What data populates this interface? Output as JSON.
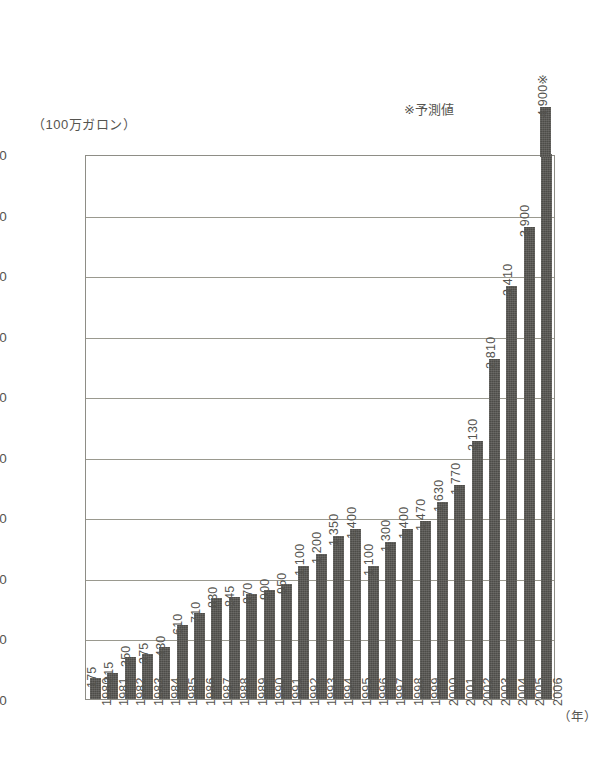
{
  "chart_data": {
    "type": "bar",
    "title": "",
    "subtitle": "",
    "xlabel": "（年）",
    "ylabel": "（100万ガロン）",
    "ylim": [
      0,
      4500
    ],
    "ytick_step": 500,
    "ytick_labels": [
      "0",
      "500",
      "1,000",
      "1,500",
      "2,000",
      "2,500",
      "3,000",
      "3,500",
      "4,000",
      "4,500"
    ],
    "ytick_values": [
      0,
      500,
      1000,
      1500,
      2000,
      2500,
      3000,
      3500,
      4000,
      4500
    ],
    "grid": true,
    "grid_axis": "y",
    "legend": false,
    "categories": [
      "1980",
      "1981",
      "1982",
      "1983",
      "1984",
      "1985",
      "1986",
      "1987",
      "1988",
      "1989",
      "1990",
      "1991",
      "1992",
      "1993",
      "1994",
      "1995",
      "1996",
      "1997",
      "1998",
      "1999",
      "2000",
      "2001",
      "2002",
      "2003",
      "2004",
      "2005",
      "2006"
    ],
    "values": [
      175,
      215,
      350,
      375,
      430,
      610,
      710,
      830,
      845,
      870,
      900,
      950,
      1100,
      1200,
      1350,
      1400,
      1100,
      1300,
      1400,
      1470,
      1630,
      1770,
      2130,
      2810,
      3410,
      3900,
      4900
    ],
    "value_labels": [
      "175",
      "215",
      "350",
      "375",
      "430",
      "610",
      "710",
      "830",
      "845",
      "870",
      "900",
      "950",
      "1,100",
      "1,200",
      "1,350",
      "1,400",
      "1,100",
      "1,300",
      "1,400",
      "1,470",
      "1,630",
      "1,770",
      "2,130",
      "2,810",
      "3,410",
      "3,900",
      "4,900※"
    ],
    "annotations": [
      {
        "name": "forecast-note",
        "text": "※予測値"
      }
    ],
    "series_color": "#4d4c48",
    "axis_color": "#8e8d86",
    "grid_color": "#9a998f",
    "text_color": "#55544f",
    "background": "#ffffff"
  }
}
